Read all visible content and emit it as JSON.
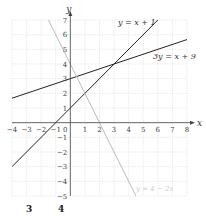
{
  "chart_data": {
    "type": "line",
    "title": "",
    "xlabel": "x",
    "ylabel": "y",
    "xlim": [
      -4,
      8
    ],
    "ylim": [
      -5,
      7
    ],
    "x_ticks": [
      -4,
      -3,
      -2,
      -1,
      0,
      1,
      2,
      3,
      4,
      5,
      6,
      7,
      8
    ],
    "y_ticks": [
      -5,
      -4,
      -3,
      -2,
      -1,
      1,
      2,
      3,
      4,
      5,
      6,
      7
    ],
    "grid": true,
    "series": [
      {
        "name": "y = x + 1",
        "slope": 1,
        "intercept": 1,
        "color": "#222222",
        "points": [
          [
            -4,
            -3
          ],
          [
            6,
            7
          ]
        ]
      },
      {
        "name": "3y = x + 9",
        "slope": 0.3333,
        "intercept": 3,
        "color": "#222222",
        "points": [
          [
            -4,
            1.667
          ],
          [
            8,
            5.667
          ]
        ]
      },
      {
        "name": "y = 4 − 2x",
        "slope": -2,
        "intercept": 4,
        "color": "#bbbbbb",
        "points": [
          [
            -1.5,
            7
          ],
          [
            4.5,
            -5
          ]
        ]
      }
    ],
    "annotations": [
      {
        "text": "y = x + 1",
        "x": 4.6,
        "y": 6.6
      },
      {
        "text": "3y = x + 9",
        "x": 5.8,
        "y": 4.6
      },
      {
        "text": "y = 4 − 2x",
        "x": 4.6,
        "y": -4.6
      }
    ]
  },
  "labels": {
    "x_axis": "x",
    "y_axis": "y",
    "line1": "y = x + 1",
    "line2": "3y = x + 9",
    "line3": "y = 4 − 2x",
    "bottom_left": "3",
    "bottom_right": "4"
  }
}
